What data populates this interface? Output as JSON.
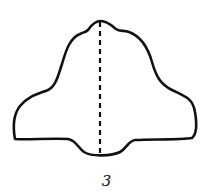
{
  "figure": {
    "label": "3",
    "stroke_color": "#111111",
    "background": "#ffffff",
    "shape": "bell-shaped outline with dashed vertical symmetry axis"
  }
}
